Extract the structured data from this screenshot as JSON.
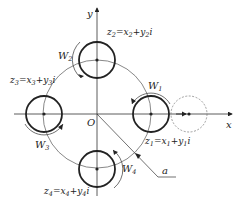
{
  "axes": {
    "x_label": "x",
    "y_label": "y",
    "origin_label": "O"
  },
  "circles": [
    {
      "id": "z1",
      "label": "z",
      "sub": "1",
      "eq": "=x",
      "eq_sub": "1",
      "plus": "+y",
      "plus_sub": "1",
      "unit": "i",
      "moment": "W",
      "moment_sub": "1"
    },
    {
      "id": "z2",
      "label": "z",
      "sub": "2",
      "eq": "=x",
      "eq_sub": "2",
      "plus": "+y",
      "plus_sub": "2",
      "unit": "i",
      "moment": "W",
      "moment_sub": "2"
    },
    {
      "id": "z3",
      "label": "z",
      "sub": "3",
      "eq": "=x",
      "eq_sub": "3",
      "plus": "+y",
      "plus_sub": "3",
      "unit": "i",
      "moment": "W",
      "moment_sub": "3"
    },
    {
      "id": "z4",
      "label": "z",
      "sub": "4",
      "eq": "=x",
      "eq_sub": "4",
      "plus": "+y",
      "plus_sub": "4",
      "unit": "i",
      "moment": "W",
      "moment_sub": "4"
    }
  ],
  "radius_label": "a",
  "colors": {
    "stroke": "#222222",
    "thin": "#555555",
    "dashed": "#777777"
  }
}
